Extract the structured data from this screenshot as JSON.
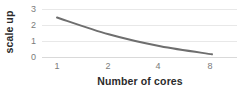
{
  "chart_data": {
    "type": "line",
    "title": "",
    "xlabel": "Number of cores",
    "ylabel": "scale up",
    "x": [
      1,
      2,
      4,
      8
    ],
    "x_tick_labels": [
      "1",
      "2",
      "4",
      "8"
    ],
    "y_tick_labels": [
      "0",
      "1",
      "2",
      "3"
    ],
    "ylim": [
      0,
      3
    ],
    "y_ticks": [
      0,
      1,
      2,
      3
    ],
    "grid": true,
    "legend": "none",
    "series": [
      {
        "name": "scale up",
        "color": "#6e6e6e",
        "values": [
          2.5,
          1.45,
          0.7,
          0.2
        ]
      }
    ]
  },
  "axes": {
    "y_title": "scale up",
    "x_title": "Number of cores",
    "y_ticks": [
      {
        "label": "3",
        "top": 5
      },
      {
        "label": "2",
        "top": 21
      },
      {
        "label": "1",
        "top": 37
      },
      {
        "label": "0",
        "top": 53
      }
    ],
    "x_ticks": [
      {
        "label": "1",
        "left": 47
      },
      {
        "label": "2",
        "left": 98
      },
      {
        "label": "4",
        "left": 148
      },
      {
        "label": "8",
        "left": 200
      }
    ]
  },
  "colors": {
    "line": "#6e6e6e",
    "gridline": "#e8e8e8",
    "axis": "#d9d9d9",
    "tick_text": "#7b7b7b",
    "title_text": "#2b2b2b",
    "background": "#ffffff"
  }
}
